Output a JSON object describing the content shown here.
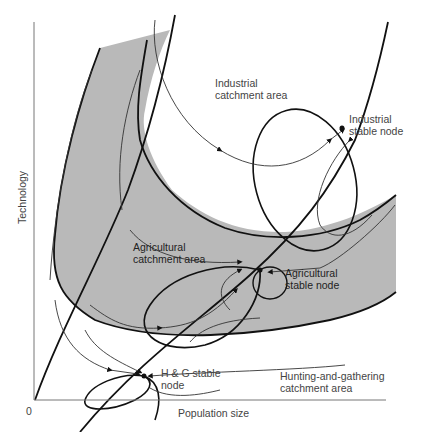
{
  "figure": {
    "cut_title": "",
    "x_axis_label": "Population size",
    "y_axis_label": "Technology",
    "origin_label": "0"
  },
  "regions": [
    {
      "id": "industrial-catchment",
      "label": "Industrial\ncatchment area"
    },
    {
      "id": "agricultural-catchment",
      "label": "Agricultural\ncatchment area"
    },
    {
      "id": "hunting-catchment",
      "label": "Hunting-and-gathering\ncatchment area"
    }
  ],
  "nodes": [
    {
      "id": "industrial-node",
      "label": "Industrial\nstable node"
    },
    {
      "id": "agricultural-node",
      "label": "Agricultural\nstable node"
    },
    {
      "id": "hg-node",
      "label": "H & G stable\nnode"
    }
  ],
  "colors": {
    "band_fill": "#b9b9b9",
    "stroke": "#111111",
    "thin_stroke": "#333333",
    "axis": "#777777",
    "text": "#444444"
  }
}
